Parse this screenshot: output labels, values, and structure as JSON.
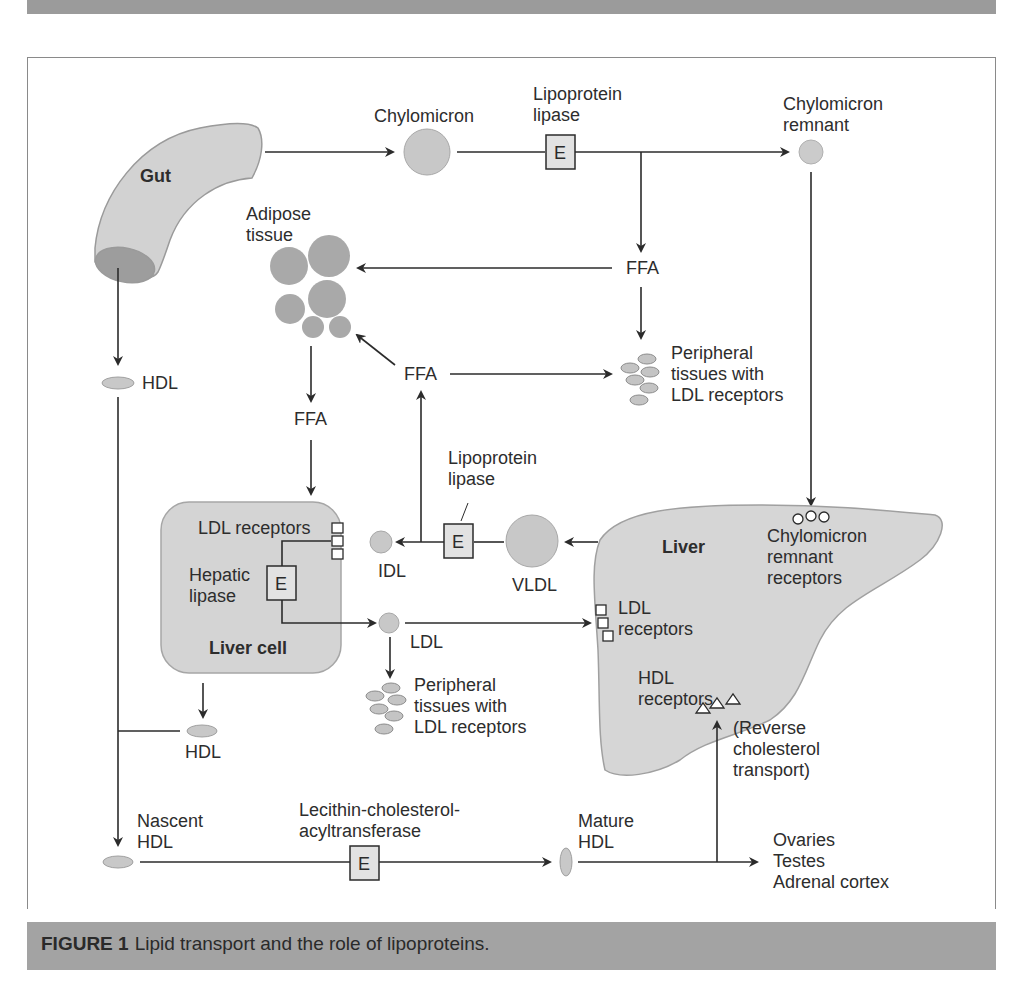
{
  "figure": {
    "number_label": "FIGURE 1",
    "caption": "Lipid transport and the role of lipoproteins.",
    "colors": {
      "band": "#9b9b9b",
      "caption_band": "#a3a3a3",
      "organ_fill": "#d6d6d6",
      "particle_fill": "#c8c8c8",
      "adipose_fill": "#a9a9a9",
      "line": "#2b2b2b"
    }
  },
  "nodes": {
    "gut": "Gut",
    "chylomicron": "Chylomicron",
    "lpl_top": [
      "Lipoprotein",
      "lipase"
    ],
    "chylo_remnant": [
      "Chylomicron",
      "remnant"
    ],
    "adipose": [
      "Adipose",
      "tissue"
    ],
    "ffa_top": "FFA",
    "ffa_mid": "FFA",
    "ffa_left": "FFA",
    "hdl_left": "HDL",
    "peripheral_top": [
      "Peripheral",
      "tissues with",
      "LDL receptors"
    ],
    "lpl_mid": [
      "Lipoprotein",
      "lipase"
    ],
    "liver_cell": {
      "title": "Liver cell",
      "ldl_receptors": "LDL receptors",
      "hepatic_lipase": [
        "Hepatic",
        "lipase"
      ]
    },
    "idl": "IDL",
    "vldl": "VLDL",
    "ldl": "LDL",
    "peripheral_bottom": [
      "Peripheral",
      "tissues with",
      "LDL receptors"
    ],
    "hdl_liver_cell": "HDL",
    "liver": {
      "title": "Liver",
      "chylo_receptors": [
        "Chylomicron",
        "remnant",
        "receptors"
      ],
      "ldl_receptors": [
        "LDL",
        "receptors"
      ],
      "hdl_receptors": [
        "HDL",
        "receptors"
      ]
    },
    "reverse_transport": [
      "(Reverse",
      "cholesterol",
      "transport)"
    ],
    "nascent_hdl": [
      "Nascent",
      "HDL"
    ],
    "lcat": [
      "Lecithin-cholesterol-",
      "acyltransferase"
    ],
    "mature_hdl": [
      "Mature",
      "HDL"
    ],
    "targets": [
      "Ovaries",
      "Testes",
      "Adrenal cortex"
    ],
    "enzyme_symbol": "E"
  },
  "edges": [
    {
      "from": "Gut",
      "to": "Chylomicron"
    },
    {
      "from": "Chylomicron",
      "to": "Chylomicron remnant",
      "via": "Lipoprotein lipase"
    },
    {
      "from": "Lipoprotein lipase",
      "to": "FFA"
    },
    {
      "from": "FFA",
      "to": "Adipose tissue"
    },
    {
      "from": "FFA",
      "to": "Peripheral tissues with LDL receptors"
    },
    {
      "from": "Chylomicron remnant",
      "to": "Chylomicron remnant receptors (Liver)"
    },
    {
      "from": "Adipose tissue",
      "to": "FFA"
    },
    {
      "from": "FFA",
      "to": "Liver cell"
    },
    {
      "from": "Gut",
      "to": "HDL"
    },
    {
      "from": "Liver",
      "to": "VLDL"
    },
    {
      "from": "VLDL",
      "to": "IDL",
      "via": "Lipoprotein lipase"
    },
    {
      "from": "Lipoprotein lipase",
      "to": "FFA"
    },
    {
      "from": "FFA",
      "to": "Adipose tissue"
    },
    {
      "from": "FFA",
      "to": "Peripheral tissues with LDL receptors"
    },
    {
      "from": "IDL",
      "to": "LDL",
      "via": "Hepatic lipase"
    },
    {
      "from": "LDL",
      "to": "LDL receptors (Liver)"
    },
    {
      "from": "LDL",
      "to": "Peripheral tissues with LDL receptors"
    },
    {
      "from": "Liver cell",
      "to": "HDL"
    },
    {
      "from": "HDL",
      "to": "Nascent HDL"
    },
    {
      "from": "Nascent HDL",
      "to": "Mature HDL",
      "via": "Lecithin-cholesterol-acyltransferase"
    },
    {
      "from": "Mature HDL",
      "to": "HDL receptors (Liver)",
      "label": "(Reverse cholesterol transport)"
    },
    {
      "from": "Mature HDL",
      "to": "Ovaries / Testes / Adrenal cortex"
    }
  ]
}
